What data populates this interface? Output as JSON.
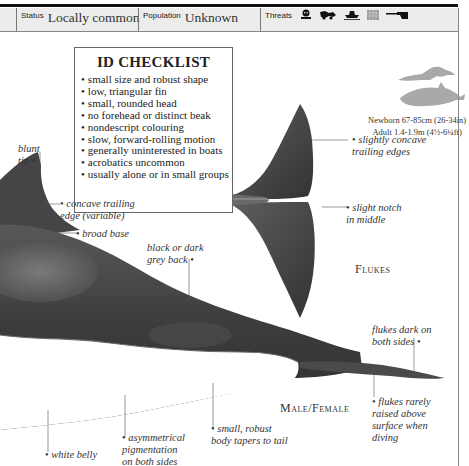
{
  "info_bar": {
    "status": {
      "label": "Status",
      "value": "Locally common"
    },
    "population": {
      "label": "Population",
      "value": "Unknown"
    },
    "threats": {
      "label": "Threats",
      "icons": [
        "pollution-skull-icon",
        "hunting-harpoon-icon",
        "boat-collision-icon",
        "fishing-net-icon",
        "gun-icon"
      ]
    }
  },
  "checklist": {
    "title": "ID CHECKLIST",
    "items": [
      "small size and robust shape",
      "low, triangular fin",
      "small, rounded head",
      "no forehead or distinct beak",
      "nondescript colouring",
      "slow, forward-rolling motion",
      "generally uninterested in boats",
      "acrobatics uncommon",
      "usually alone or in small groups"
    ]
  },
  "size_comparison": {
    "newborn": "Newborn 67-85cm (26-34in)",
    "adult": "Adult 1.4-1.9m (4½-6¼ft)"
  },
  "annotations": {
    "blunt_tip": [
      "blunt",
      "tip"
    ],
    "concave_trailing_edge": [
      "concave trailing",
      "edge (variable)"
    ],
    "broad_base": "broad base",
    "back": [
      "black or dark",
      "grey back"
    ],
    "flukes_trailing": [
      "slightly concave",
      "trailing edges"
    ],
    "notch": [
      "slight notch",
      "in middle"
    ],
    "flukes_dark": [
      "flukes dark on",
      "both sides"
    ],
    "flukes_rarely": [
      "flukes rarely",
      "raised above",
      "surface when",
      "diving"
    ],
    "body_tapers": [
      "small, robust",
      "body tapers to tail"
    ],
    "asymmetrical": [
      "asymmetrical",
      "pigmentation",
      "on both sides"
    ],
    "white_belly": "white belly"
  },
  "section_labels": {
    "flukes": "Flukes",
    "male_female": "Male/Female"
  },
  "colors": {
    "body_dark": "#3a3a3c",
    "belly": "#ffffff",
    "silhouette": "#a9a9a9",
    "bar_bg": "#ececec"
  }
}
